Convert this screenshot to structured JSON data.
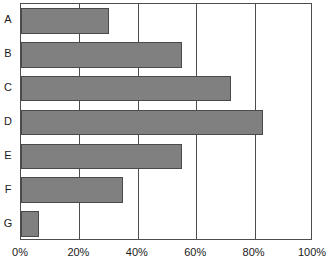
{
  "chart_data": {
    "type": "bar",
    "orientation": "horizontal",
    "title": "",
    "subtitle": "",
    "xlabel": "",
    "ylabel": "",
    "categories": [
      "A",
      "B",
      "C",
      "D",
      "E",
      "F",
      "G"
    ],
    "values": [
      30,
      55,
      72,
      83,
      55,
      35,
      6
    ],
    "series": [
      {
        "name": "",
        "values": [
          30,
          55,
          72,
          83,
          55,
          35,
          6
        ]
      }
    ],
    "xlim": [
      0,
      100
    ],
    "xticks": [
      0,
      20,
      40,
      60,
      80,
      100
    ],
    "xtick_labels": [
      "0%",
      "20%",
      "40%",
      "60%",
      "80%",
      "100%"
    ],
    "grid": true,
    "grid_axis": "x",
    "legend": false,
    "legend_position": "none",
    "bar_color": "#808080",
    "bar_border_color": "#4a4a4a",
    "axis_color": "#4d4d4d",
    "background_color": "#ffffff",
    "text_color": "#1a1a1a",
    "annotations": []
  }
}
